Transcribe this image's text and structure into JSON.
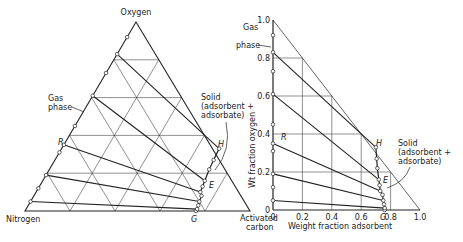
{
  "left_diagram": {
    "type": "ternary",
    "vertex_labels": {
      "top": "Oxygen",
      "bottom_left": "Nitrogen",
      "bottom_right_line1": "Activated",
      "bottom_right_line2": "carbon"
    },
    "gas_phase_label": [
      "Gas",
      "phase"
    ],
    "solid_label": [
      "Solid",
      "(adsorbent +",
      "adsorbate)"
    ],
    "point_labels": {
      "R": "R",
      "H": "H",
      "E": "E",
      "G": "G"
    },
    "grid_step": 0.2,
    "gas_points_oxygen_fraction": [
      0.92,
      0.83,
      0.73,
      0.61,
      0.45,
      0.35,
      0.31,
      0.19,
      0.12,
      0.05
    ],
    "tie_lines": [
      {
        "gas_o": 0.83,
        "solid_o": 0.33,
        "solid_c": 0.7
      },
      {
        "gas_o": 0.61,
        "solid_o": 0.16,
        "solid_c": 0.72
      },
      {
        "gas_o": 0.35,
        "solid_o": 0.1,
        "solid_c": 0.73
      },
      {
        "gas_o": 0.19,
        "solid_o": 0.05,
        "solid_c": 0.75
      },
      {
        "gas_o": 0.05,
        "solid_o": 0.01,
        "solid_c": 0.76
      }
    ],
    "solid_curve": [
      [
        0.76,
        0.0
      ],
      [
        0.76,
        0.01
      ],
      [
        0.755,
        0.03
      ],
      [
        0.75,
        0.05
      ],
      [
        0.745,
        0.08
      ],
      [
        0.73,
        0.1
      ],
      [
        0.725,
        0.13
      ],
      [
        0.72,
        0.16
      ],
      [
        0.71,
        0.22
      ],
      [
        0.705,
        0.27
      ],
      [
        0.7,
        0.33
      ]
    ]
  },
  "chart_data": {
    "type": "line",
    "title": "",
    "xlabel": "Weight fraction adsorbent",
    "ylabel": "Wt fraction oxygen",
    "xlim": [
      0,
      1.0
    ],
    "ylim": [
      0,
      1.0
    ],
    "x_ticks": [
      "0",
      "0.2",
      "0.4",
      "0.6",
      "0.8",
      "1.0"
    ],
    "y_ticks": [
      "0",
      "0.2",
      "0.4",
      "0.6",
      "0.8",
      "1.0"
    ],
    "grid": true,
    "gas_phase_label": [
      "Gas",
      "phase"
    ],
    "solid_label": [
      "Solid",
      "(adsorbent +",
      "adsorbate)"
    ],
    "point_labels": {
      "R": "R",
      "H": "H",
      "E": "E",
      "G": "G"
    },
    "gas_points_y": [
      0.92,
      0.83,
      0.73,
      0.61,
      0.45,
      0.35,
      0.31,
      0.19,
      0.12,
      0.05
    ],
    "tie_lines": [
      {
        "gas_y": 0.83,
        "solid_x": 0.7,
        "solid_y": 0.33
      },
      {
        "gas_y": 0.61,
        "solid_x": 0.72,
        "solid_y": 0.16
      },
      {
        "gas_y": 0.35,
        "solid_x": 0.73,
        "solid_y": 0.1
      },
      {
        "gas_y": 0.19,
        "solid_x": 0.75,
        "solid_y": 0.05
      },
      {
        "gas_y": 0.05,
        "solid_x": 0.76,
        "solid_y": 0.01
      }
    ],
    "solid_curve": [
      [
        0.76,
        0.0
      ],
      [
        0.76,
        0.01
      ],
      [
        0.755,
        0.03
      ],
      [
        0.75,
        0.05
      ],
      [
        0.745,
        0.08
      ],
      [
        0.73,
        0.1
      ],
      [
        0.725,
        0.13
      ],
      [
        0.72,
        0.16
      ],
      [
        0.71,
        0.22
      ],
      [
        0.705,
        0.27
      ],
      [
        0.7,
        0.33
      ]
    ]
  }
}
